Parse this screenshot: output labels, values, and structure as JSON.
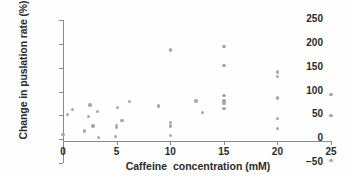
{
  "chart_data": {
    "type": "scatter",
    "title": "",
    "xlabel": "Caffeine  concentration (mM)",
    "ylabel": "Change in puslation rate (%)",
    "xlim": [
      0,
      25
    ],
    "ylim": [
      -50,
      250
    ],
    "xticks": [
      0,
      5,
      10,
      15,
      20,
      25
    ],
    "xticklabels": [
      "0",
      "5",
      "10",
      "15",
      "20",
      "25"
    ],
    "yticks": [
      -50,
      0,
      50,
      100,
      150,
      200,
      250
    ],
    "yticklabels": [
      "−50",
      "0",
      "50",
      "100",
      "150",
      "200",
      "250"
    ],
    "grid": false,
    "legend": null,
    "marker_color": "#a8a8a8",
    "axis_color": "#8a8a8a",
    "text_color": "#2b2b2b",
    "points": [
      {
        "x": 0.0,
        "y": 10
      },
      {
        "x": 0.4,
        "y": 52
      },
      {
        "x": 0.9,
        "y": 62
      },
      {
        "x": 2.0,
        "y": 17
      },
      {
        "x": 2.4,
        "y": 48
      },
      {
        "x": 2.5,
        "y": 72
      },
      {
        "x": 2.8,
        "y": 28
      },
      {
        "x": 3.2,
        "y": 58
      },
      {
        "x": 3.3,
        "y": 4
      },
      {
        "x": 4.9,
        "y": 5
      },
      {
        "x": 5.0,
        "y": 24
      },
      {
        "x": 5.0,
        "y": 29
      },
      {
        "x": 5.1,
        "y": 67
      },
      {
        "x": 5.5,
        "y": 39
      },
      {
        "x": 6.2,
        "y": 79
      },
      {
        "x": 8.9,
        "y": 70
      },
      {
        "x": 10.0,
        "y": 8
      },
      {
        "x": 10.0,
        "y": 28
      },
      {
        "x": 10.0,
        "y": 35
      },
      {
        "x": 10.0,
        "y": 187
      },
      {
        "x": 12.4,
        "y": 80
      },
      {
        "x": 13.0,
        "y": 56
      },
      {
        "x": 15.0,
        "y": 64
      },
      {
        "x": 15.0,
        "y": 75
      },
      {
        "x": 15.0,
        "y": 80
      },
      {
        "x": 15.0,
        "y": 91
      },
      {
        "x": 15.0,
        "y": 154
      },
      {
        "x": 15.0,
        "y": 194
      },
      {
        "x": 20.0,
        "y": 23
      },
      {
        "x": 20.0,
        "y": 44
      },
      {
        "x": 20.0,
        "y": 86
      },
      {
        "x": 20.0,
        "y": 132
      },
      {
        "x": 20.0,
        "y": 141
      },
      {
        "x": 25.0,
        "y": -45
      },
      {
        "x": 25.0,
        "y": 50
      },
      {
        "x": 25.0,
        "y": 94
      }
    ]
  }
}
